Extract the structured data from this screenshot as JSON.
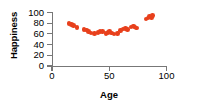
{
  "chart_data": {
    "type": "scatter",
    "title": "",
    "xlabel": "Age",
    "ylabel": "Happiness",
    "xlim": [
      0,
      100
    ],
    "ylim": [
      0,
      100
    ],
    "xticks": [
      0,
      50,
      100
    ],
    "yticks": [
      0,
      20,
      40,
      60,
      80,
      100
    ],
    "xtick_labels": [
      "0",
      "50",
      "100"
    ],
    "ytick_labels": [
      "0",
      "20",
      "40",
      "60",
      "80",
      "100"
    ],
    "grid": false,
    "legend": false,
    "marker_color": "#E8401C",
    "axis_color": "#777777",
    "text_color": "#000000",
    "series": [
      {
        "name": "Happiness by age",
        "points": [
          {
            "x": 15,
            "y": 79
          },
          {
            "x": 17,
            "y": 78
          },
          {
            "x": 19,
            "y": 76
          },
          {
            "x": 22,
            "y": 72
          },
          {
            "x": 28,
            "y": 68
          },
          {
            "x": 30,
            "y": 67
          },
          {
            "x": 32,
            "y": 64
          },
          {
            "x": 34,
            "y": 62
          },
          {
            "x": 37,
            "y": 61
          },
          {
            "x": 40,
            "y": 63
          },
          {
            "x": 42,
            "y": 65
          },
          {
            "x": 44,
            "y": 64
          },
          {
            "x": 47,
            "y": 61
          },
          {
            "x": 49,
            "y": 63
          },
          {
            "x": 50,
            "y": 65
          },
          {
            "x": 52,
            "y": 62
          },
          {
            "x": 54,
            "y": 60
          },
          {
            "x": 57,
            "y": 61
          },
          {
            "x": 60,
            "y": 66
          },
          {
            "x": 62,
            "y": 69
          },
          {
            "x": 64,
            "y": 70
          },
          {
            "x": 66,
            "y": 68
          },
          {
            "x": 69,
            "y": 73
          },
          {
            "x": 71,
            "y": 75
          },
          {
            "x": 72,
            "y": 73
          },
          {
            "x": 74,
            "y": 71
          },
          {
            "x": 82,
            "y": 88
          },
          {
            "x": 84,
            "y": 90
          },
          {
            "x": 85,
            "y": 92
          },
          {
            "x": 87,
            "y": 91
          },
          {
            "x": 88,
            "y": 94
          }
        ]
      }
    ]
  }
}
